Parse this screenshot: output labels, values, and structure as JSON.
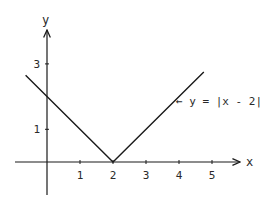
{
  "chart_data": {
    "type": "line",
    "title": "",
    "xlabel": "x",
    "ylabel": "y",
    "function": "y = |x - 2|",
    "series": [
      {
        "name": "y = |x - 2|",
        "x": [
          -0.65,
          0,
          2,
          4.75
        ],
        "y": [
          2.65,
          2,
          0,
          2.75
        ]
      }
    ],
    "x_ticks": [
      1,
      2,
      3,
      4,
      5
    ],
    "x_tick_labels": [
      "1",
      "2",
      "3",
      "4",
      "5"
    ],
    "y_ticks": [
      1,
      3
    ],
    "y_tick_labels": [
      "1",
      "3"
    ],
    "xlim": [
      -0.95,
      5.85
    ],
    "ylim": [
      -1,
      3.8
    ],
    "grid": false,
    "legend": "none",
    "annotation": {
      "text": "← y = |x - 2|",
      "points_to": "right branch of V"
    },
    "colors": {
      "line": "#1a1a1a",
      "axes": "#1a1a1a",
      "background": "#ffffff"
    }
  }
}
